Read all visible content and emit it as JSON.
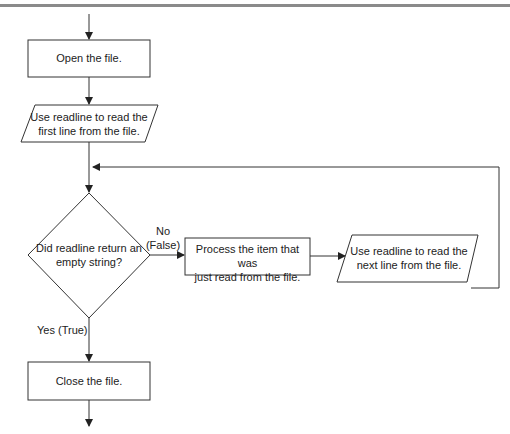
{
  "diagram": {
    "type": "flowchart",
    "nodes": [
      {
        "id": "open",
        "shape": "process",
        "text": "Open the file."
      },
      {
        "id": "read_first",
        "shape": "input-output",
        "line1": "Use readline to read the",
        "line2": "first line from the file."
      },
      {
        "id": "decision",
        "shape": "decision",
        "line1": "Did readline return an",
        "line2": "empty string?"
      },
      {
        "id": "process_item",
        "shape": "process",
        "line1": "Process the item that was",
        "line2": "just read from the file."
      },
      {
        "id": "read_next",
        "shape": "input-output",
        "line1": "Use readline to read the",
        "line2": "next line from the file."
      },
      {
        "id": "close",
        "shape": "process",
        "text": "Close the file."
      }
    ],
    "edge_labels": {
      "no_line1": "No",
      "no_line2": "(False)",
      "yes": "Yes (True)"
    },
    "colors": {
      "stroke": "#333333",
      "rule": "#8a8a8a",
      "background": "#ffffff"
    }
  }
}
